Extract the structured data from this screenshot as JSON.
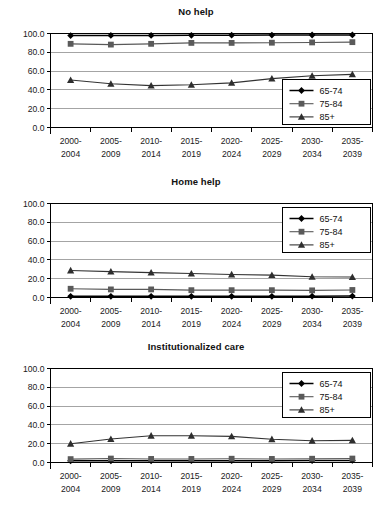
{
  "figure": {
    "panel_count": 3,
    "shared_categories": [
      "2000-2004",
      "2005-2009",
      "2010-2014",
      "2015-2019",
      "2020-2024",
      "2025-2029",
      "2030-2034",
      "2035-2039"
    ],
    "shared_ytick_labels": [
      "0.0",
      "20.0",
      "40.0",
      "60.0",
      "80.0",
      "100.0"
    ],
    "legend_labels": [
      "65-74",
      "75-84",
      "85+"
    ],
    "marker_names": [
      "diamond-marker",
      "square-marker",
      "triangle-marker"
    ],
    "colors": {
      "series_65_74": "#000000",
      "series_75_84": "#595959",
      "series_85_plus": "#333333",
      "gridline": "#9a9a9a",
      "axis": "#000000",
      "background": "#ffffff"
    }
  },
  "chart_data": [
    {
      "type": "line",
      "title": "No help",
      "xlabel": "",
      "ylabel": "",
      "ylim": [
        0,
        100
      ],
      "yticks": [
        0,
        20,
        40,
        60,
        80,
        100
      ],
      "ytick_labels": [
        "0.0",
        "20.0",
        "40.0",
        "60.0",
        "80.0",
        "100.0"
      ],
      "grid": true,
      "legend_position": "lower-right",
      "categories": [
        "2000-2004",
        "2005-2009",
        "2010-2014",
        "2015-2019",
        "2020-2024",
        "2025-2029",
        "2030-2034",
        "2035-2039"
      ],
      "series": [
        {
          "name": "65-74",
          "marker": "diamond",
          "values": [
            97.8,
            97.9,
            98.0,
            98.1,
            98.2,
            98.3,
            98.4,
            98.5
          ]
        },
        {
          "name": "75-84",
          "marker": "square",
          "values": [
            89.0,
            88.2,
            89.0,
            90.0,
            90.0,
            90.2,
            90.5,
            90.8
          ]
        },
        {
          "name": "85+",
          "marker": "triangle",
          "values": [
            50.5,
            46.5,
            44.5,
            45.5,
            47.5,
            52.0,
            55.0,
            56.5
          ]
        }
      ]
    },
    {
      "type": "line",
      "title": "Home help",
      "xlabel": "",
      "ylabel": "",
      "ylim": [
        0,
        100
      ],
      "yticks": [
        0,
        20,
        40,
        60,
        80,
        100
      ],
      "ytick_labels": [
        "0.0",
        "20.0",
        "40.0",
        "60.0",
        "80.0",
        "100.0"
      ],
      "grid": true,
      "legend_position": "upper-right",
      "categories": [
        "2000-2004",
        "2005-2009",
        "2010-2014",
        "2015-2019",
        "2020-2024",
        "2025-2029",
        "2030-2034",
        "2035-2039"
      ],
      "series": [
        {
          "name": "65-74",
          "marker": "diamond",
          "values": [
            1.2,
            1.2,
            1.2,
            1.3,
            1.3,
            1.3,
            1.4,
            1.5
          ]
        },
        {
          "name": "75-84",
          "marker": "square",
          "values": [
            9.3,
            8.6,
            8.6,
            7.8,
            7.8,
            7.8,
            7.6,
            8.0
          ]
        },
        {
          "name": "85+",
          "marker": "triangle",
          "values": [
            28.8,
            27.5,
            26.5,
            25.5,
            24.5,
            23.8,
            22.0,
            21.8
          ]
        }
      ]
    },
    {
      "type": "line",
      "title": "Institutionalized care",
      "xlabel": "",
      "ylabel": "",
      "ylim": [
        0,
        100
      ],
      "yticks": [
        0,
        20,
        40,
        60,
        80,
        100
      ],
      "ytick_labels": [
        "0.0",
        "20.0",
        "40.0",
        "60.0",
        "80.0",
        "100.0"
      ],
      "grid": true,
      "legend_position": "upper-right",
      "categories": [
        "2000-2004",
        "2005-2009",
        "2010-2014",
        "2015-2019",
        "2020-2024",
        "2025-2029",
        "2030-2034",
        "2035-2039"
      ],
      "series": [
        {
          "name": "65-74",
          "marker": "diamond",
          "values": [
            1.8,
            1.8,
            1.8,
            1.9,
            1.9,
            1.9,
            2.0,
            2.2
          ]
        },
        {
          "name": "75-84",
          "marker": "square",
          "values": [
            3.6,
            4.2,
            3.8,
            3.8,
            4.0,
            3.8,
            4.0,
            4.2
          ]
        },
        {
          "name": "85+",
          "marker": "triangle",
          "values": [
            20.0,
            25.0,
            28.5,
            28.5,
            27.8,
            24.8,
            23.2,
            23.5
          ]
        }
      ]
    }
  ]
}
